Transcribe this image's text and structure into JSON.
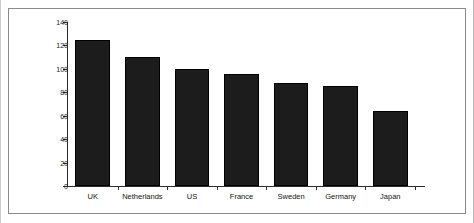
{
  "chart_data": {
    "type": "bar",
    "title": "",
    "subtitle": "",
    "xlabel": "",
    "ylabel": "",
    "categories": [
      "UK",
      "Netherlands",
      "US",
      "France",
      "Sweden",
      "Germany",
      "Japan"
    ],
    "values": [
      125,
      110,
      100,
      96,
      88,
      85,
      64
    ],
    "series": [
      {
        "name": "",
        "values": [
          125,
          110,
          100,
          96,
          88,
          85,
          64
        ]
      }
    ],
    "ylim": [
      0,
      140
    ],
    "yticks": [
      0,
      20,
      40,
      60,
      80,
      100,
      120,
      140
    ],
    "ytick_labels": [
      "0",
      "20",
      "40",
      "60",
      "80",
      "100",
      "120",
      "140"
    ],
    "grid": false,
    "legend": false,
    "legend_position": "none",
    "bar_color": "#1c1c1c",
    "bar_edge_color": "#000000",
    "axis_color": "#2b2b2b",
    "background_color": "#ffffff",
    "frame_color": "#8a8a8a",
    "annotations": []
  }
}
